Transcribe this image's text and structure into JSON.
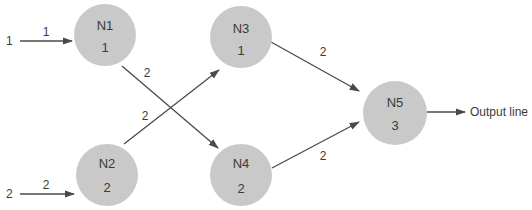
{
  "diagram": {
    "type": "neural-network",
    "inputs": [
      {
        "id": "in1",
        "value": "1",
        "weight": "1",
        "target": "N1"
      },
      {
        "id": "in2",
        "value": "2",
        "weight": "2",
        "target": "N2"
      }
    ],
    "nodes": [
      {
        "id": "N1",
        "label": "N1",
        "value": "1",
        "cx": 105,
        "cy": 35
      },
      {
        "id": "N2",
        "label": "N2",
        "value": "2",
        "cx": 107,
        "cy": 175
      },
      {
        "id": "N3",
        "label": "N3",
        "value": "1",
        "cx": 241,
        "cy": 37
      },
      {
        "id": "N4",
        "label": "N4",
        "value": "2",
        "cx": 241,
        "cy": 175
      },
      {
        "id": "N5",
        "label": "N5",
        "value": "3",
        "cx": 395,
        "cy": 113
      }
    ],
    "edges": [
      {
        "from": "N1",
        "to": "N4",
        "weight": "2"
      },
      {
        "from": "N2",
        "to": "N3",
        "weight": "2"
      },
      {
        "from": "N3",
        "to": "N5",
        "weight": "2"
      },
      {
        "from": "N4",
        "to": "N5",
        "weight": "2"
      }
    ],
    "output": {
      "from": "N5",
      "label": "Output line"
    },
    "colors": {
      "node_fill": "#c9c9c9",
      "line": "#4a4a4a",
      "text": "#3a3a3a"
    }
  }
}
